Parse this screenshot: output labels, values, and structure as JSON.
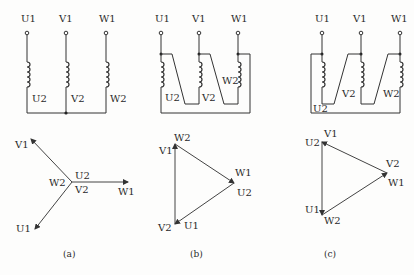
{
  "figure": {
    "panels": [
      {
        "id": "a",
        "caption": "(a)",
        "connection": "star",
        "terminals_top": [
          "U1",
          "V1",
          "W1"
        ],
        "winding_ends": [
          "U2",
          "V2",
          "W2"
        ],
        "phasor": {
          "center_labels": [
            "U2",
            "W2",
            "V2"
          ],
          "tips": [
            "V1",
            "W1",
            "U1"
          ]
        }
      },
      {
        "id": "b",
        "caption": "(b)",
        "connection": "delta",
        "terminals_top": [
          "U1",
          "V1",
          "W1"
        ],
        "winding_ends": [
          "U2",
          "V2",
          "W2"
        ],
        "phasor": {
          "vertex_labels": {
            "top": [
              "W2",
              "V1"
            ],
            "right": [
              "W1",
              "U2"
            ],
            "bottom": [
              "V2",
              "U1"
            ]
          }
        }
      },
      {
        "id": "c",
        "caption": "(c)",
        "connection": "delta",
        "terminals_top": [
          "U1",
          "V1",
          "W1"
        ],
        "winding_ends": [
          "U2",
          "V2",
          "W2"
        ],
        "phasor": {
          "vertex_labels": {
            "top": [
              "V1",
              "U2"
            ],
            "right": [
              "V2",
              "W1"
            ],
            "bottom": [
              "U1",
              "W2"
            ]
          }
        }
      }
    ]
  }
}
